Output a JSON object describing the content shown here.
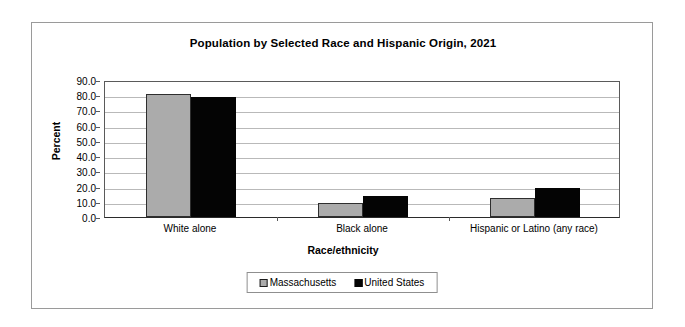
{
  "chart_data": {
    "type": "bar",
    "title": "Population by Selected Race and Hispanic Origin, 2021",
    "xlabel": "Race/ethnicity",
    "ylabel": "Percent",
    "categories": [
      "White alone",
      "Black alone",
      "Hispanic or Latino (any race)"
    ],
    "series": [
      {
        "name": "Massachusetts",
        "values": [
          80.5,
          9.5,
          12.6
        ],
        "color": "#ababab"
      },
      {
        "name": "United States",
        "values": [
          78.8,
          13.6,
          18.9
        ],
        "color": "#050505"
      }
    ],
    "ylim": [
      0.0,
      90.0
    ],
    "ytick_labels": [
      "90.0",
      "80.0",
      "70.0",
      "60.0",
      "50.0",
      "40.0",
      "30.0",
      "20.0",
      "10.0",
      "0.0"
    ],
    "ytick_values": [
      90.0,
      80.0,
      70.0,
      60.0,
      50.0,
      40.0,
      30.0,
      20.0,
      10.0,
      0.0
    ],
    "grid": true,
    "legend_position": "bottom",
    "legend_entries": [
      "Massachusetts",
      "United States"
    ]
  }
}
